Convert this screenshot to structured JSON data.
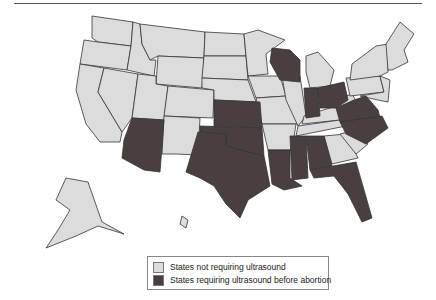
{
  "figure": {
    "title_fragment": ""
  },
  "colors": {
    "no_ultrasound": "#dcdcdc",
    "ultrasound": "#4a3f3f",
    "border": "#333333",
    "background": "#ffffff"
  },
  "legend": {
    "items": [
      {
        "label": "States not requiring ultrasound",
        "color": "#dcdcdc"
      },
      {
        "label": "States requiring ultrasound before abortion",
        "color": "#4a3f3f"
      }
    ]
  },
  "map": {
    "region": "United States",
    "states_requiring_ultrasound": [
      "Arizona",
      "Kansas",
      "Oklahoma",
      "Texas",
      "Louisiana",
      "Mississippi",
      "Alabama",
      "Florida",
      "Wisconsin",
      "Indiana",
      "Ohio",
      "Virginia",
      "North Carolina"
    ],
    "states_not_requiring_ultrasound": [
      "Washington",
      "Oregon",
      "California",
      "Nevada",
      "Idaho",
      "Montana",
      "Wyoming",
      "Utah",
      "Colorado",
      "New Mexico",
      "North Dakota",
      "South Dakota",
      "Nebraska",
      "Minnesota",
      "Iowa",
      "Missouri",
      "Arkansas",
      "Illinois",
      "Michigan",
      "Kentucky",
      "Tennessee",
      "Georgia",
      "South Carolina",
      "West Virginia",
      "Pennsylvania",
      "New York",
      "Vermont",
      "New Hampshire",
      "Maine",
      "Massachusetts",
      "Rhode Island",
      "Connecticut",
      "New Jersey",
      "Delaware",
      "Maryland",
      "Alaska",
      "Hawaii"
    ]
  }
}
